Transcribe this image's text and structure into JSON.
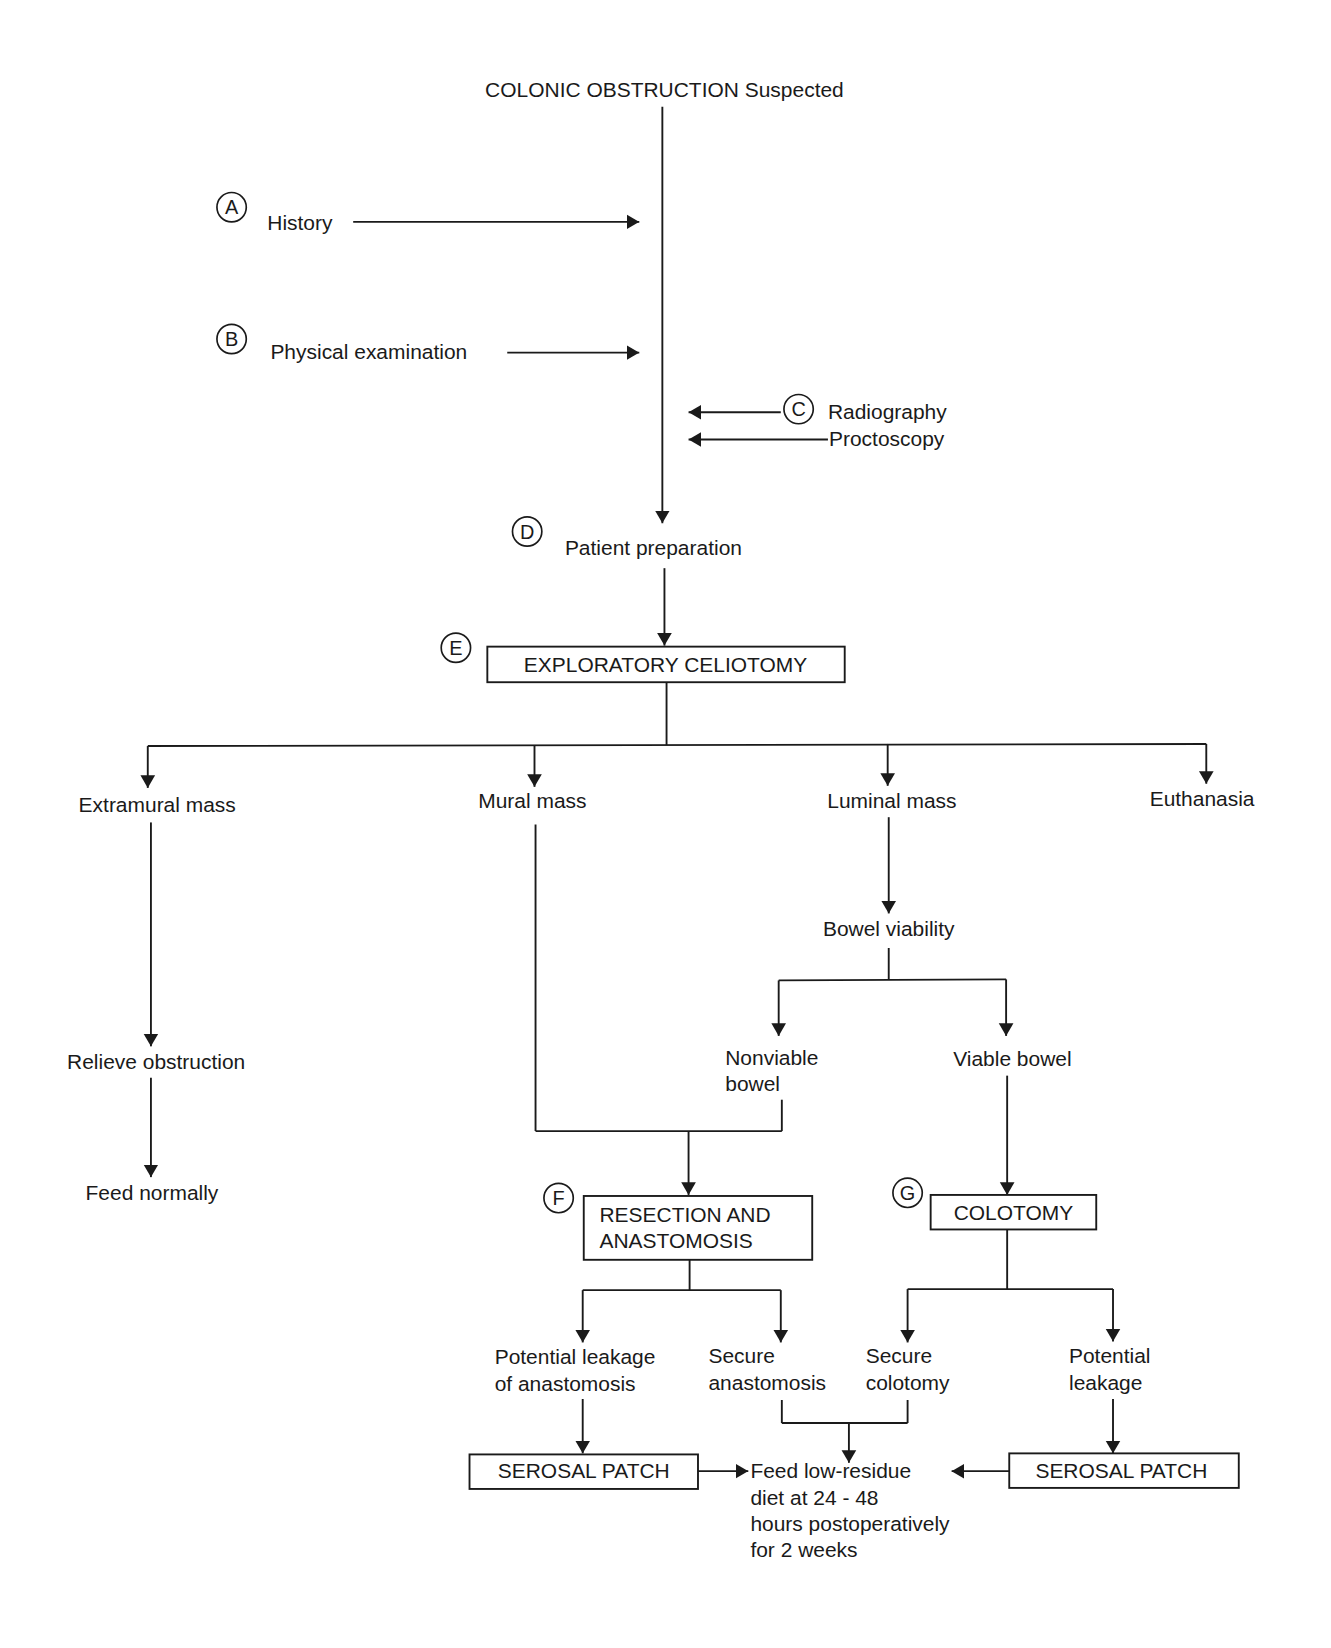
{
  "title": "COLONIC OBSTRUCTION Suspected",
  "steps": {
    "A": {
      "marker": "A",
      "label": "History"
    },
    "B": {
      "marker": "B",
      "label": "Physical examination"
    },
    "C": {
      "marker": "C",
      "label_1": "Radiography",
      "label_2": "Proctoscopy"
    },
    "D": {
      "marker": "D",
      "label": "Patient preparation"
    },
    "E": {
      "marker": "E",
      "label": "EXPLORATORY CELIOTOMY"
    },
    "F": {
      "marker": "F",
      "label_1": "RESECTION AND",
      "label_2": "ANASTOMOSIS"
    },
    "G": {
      "marker": "G",
      "label": "COLOTOMY"
    }
  },
  "branches": {
    "extramural": "Extramural mass",
    "mural": "Mural mass",
    "luminal": "Luminal mass",
    "euthanasia": "Euthanasia"
  },
  "extramural_path": {
    "relieve": "Relieve obstruction",
    "feed": "Feed normally"
  },
  "luminal_path": {
    "viability": "Bowel viability",
    "nonviable_1": "Nonviable",
    "nonviable_2": "bowel",
    "viable": "Viable bowel"
  },
  "resection_outcomes": {
    "leak_1": "Potential leakage",
    "leak_2": "of anastomosis",
    "secure_1": "Secure",
    "secure_2": "anastomosis"
  },
  "colotomy_outcomes": {
    "secure_1": "Secure",
    "secure_2": "colotomy",
    "leak_1": "Potential",
    "leak_2": "leakage"
  },
  "serosal_patch_left": "SEROSAL PATCH",
  "serosal_patch_right": "SEROSAL PATCH",
  "final": {
    "line_1": "Feed low-residue",
    "line_2": "diet at 24 - 48",
    "line_3": "hours postoperatively",
    "line_4": "for 2 weeks"
  },
  "colors": {
    "ink": "#1a1a1a",
    "background": "#ffffff"
  }
}
